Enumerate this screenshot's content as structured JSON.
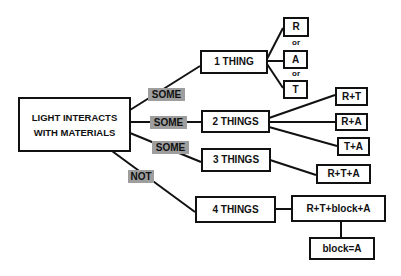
{
  "diagram": {
    "root": {
      "label": "LIGHT INTERACTS WITH MATERIALS"
    },
    "edge_labels": [
      "SOME",
      "SOME",
      "SOME",
      "NOT"
    ],
    "branches": [
      {
        "label": "1 THING",
        "outcomes": [
          "R",
          "A",
          "T"
        ],
        "separator": "or"
      },
      {
        "label": "2 THINGS",
        "outcomes": [
          "R+T",
          "R+A",
          "T+A"
        ]
      },
      {
        "label": "3 THINGS",
        "outcomes": [
          "R+T+A"
        ]
      },
      {
        "label": "4 THINGS",
        "outcomes": [
          "R+T+block+A"
        ],
        "note": "block=A"
      }
    ]
  },
  "colors": {
    "line": "#111111",
    "tag_bg": "#9e9e9e",
    "background": "#ffffff"
  }
}
